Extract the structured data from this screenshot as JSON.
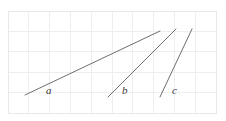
{
  "figure": {
    "title": "",
    "background_color": "#ffffff",
    "width": 226,
    "height": 121
  },
  "grid": {
    "visible": true,
    "line_color": "#eceef0",
    "border_color": "#e6e8ea",
    "x_start": 8,
    "y_start": 11,
    "cell_width": 20.8,
    "cell_height": 20.4,
    "columns": 10,
    "rows": 5
  },
  "chart_data": {
    "type": "line",
    "title": "",
    "xlabel": "",
    "ylabel": "",
    "grid": true,
    "legend_position": "inline-labels",
    "xlim": [
      0,
      10
    ],
    "ylim": [
      0,
      5
    ],
    "line_color": "#6e6e72",
    "series": [
      {
        "name": "a",
        "label": "a",
        "label_style": "italic",
        "x": [
          0.82,
          7.31
        ],
        "y": [
          0.88,
          4.02
        ],
        "slope": 0.48,
        "px_start": [
          25,
          95
        ],
        "px_end": [
          160,
          31
        ],
        "label_px": [
          46,
          94
        ]
      },
      {
        "name": "b",
        "label": "b",
        "label_style": "italic",
        "x": [
          4.81,
          8.08
        ],
        "y": [
          0.78,
          4.12
        ],
        "slope": 1.02,
        "px_start": [
          108,
          97
        ],
        "px_end": [
          176,
          29
        ],
        "label_px": [
          122,
          94
        ]
      },
      {
        "name": "c",
        "label": "c",
        "label_style": "italic",
        "x": [
          7.31,
          8.85
        ],
        "y": [
          0.78,
          4.12
        ],
        "slope": 2.18,
        "px_start": [
          160,
          97
        ],
        "px_end": [
          192,
          29
        ],
        "label_px": [
          172,
          94
        ]
      }
    ]
  }
}
